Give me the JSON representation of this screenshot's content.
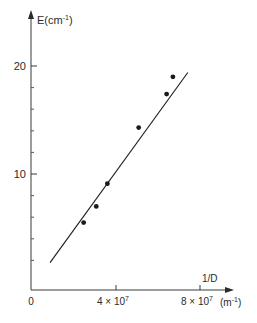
{
  "chart_data": {
    "type": "scatter",
    "title": "",
    "xlabel": "1/D",
    "xunit": "(m⁻¹)",
    "ylabel": "E(cm⁻¹)",
    "x_ticks": [
      {
        "value": 0,
        "label": "0"
      },
      {
        "value": 40000000,
        "label": "4 × 10",
        "exp": "7"
      },
      {
        "value": 80000000,
        "label": "8 × 10",
        "exp": "7"
      }
    ],
    "y_ticks": [
      {
        "value": 10,
        "label": "10"
      },
      {
        "value": 20,
        "label": "20"
      }
    ],
    "y_minor_ticks": [
      2,
      4,
      6,
      8,
      12,
      14,
      16,
      18
    ],
    "xlim": [
      0,
      95000000
    ],
    "ylim": [
      -0.7,
      25
    ],
    "grid": false,
    "legend": null,
    "series": [
      {
        "name": "measured",
        "kind": "points",
        "x": [
          24600000,
          30600000,
          35900000,
          50800000,
          64100000,
          67100000
        ],
        "y": [
          5.5,
          7.0,
          9.1,
          14.3,
          17.4,
          19.0
        ]
      },
      {
        "name": "linear fit",
        "kind": "line",
        "x": [
          8600000,
          74200000
        ],
        "y": [
          1.8,
          19.4
        ]
      }
    ]
  },
  "colors": {
    "ink": "#1a1a1a",
    "axis": "#3a3a3a",
    "background": "#ffffff"
  }
}
